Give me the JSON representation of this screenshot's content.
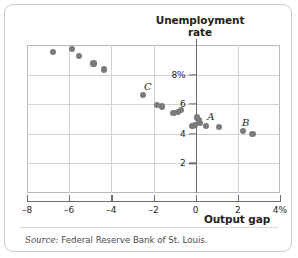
{
  "figure": {
    "title_line1": "Unemployment",
    "title_line2": "rate",
    "source_label": "Source:",
    "source_text": "Federal Reserve Bank of St. Louis."
  },
  "chart_data": {
    "type": "scatter",
    "title": "Unemployment rate",
    "xlabel": "Output gap",
    "ylabel": "Unemployment rate",
    "xlim": [
      -8,
      4
    ],
    "ylim": [
      0,
      10
    ],
    "xticks": [
      -8,
      -6,
      -4,
      -2,
      0,
      2,
      4
    ],
    "xticklabels": [
      "–8",
      "–6",
      "–4",
      "–2",
      "0",
      "2",
      "4%"
    ],
    "yticks": [
      2,
      4,
      6,
      8
    ],
    "yticklabels": [
      "2",
      "4",
      "6",
      "8%"
    ],
    "grid": true,
    "legend": "none",
    "point_color": "#7b7b7b",
    "axis_color": "#6d6d6d",
    "grid_color": "#d2d2d2",
    "points": [
      {
        "x": -6.75,
        "y": 9.5
      },
      {
        "x": -5.85,
        "y": 9.75
      },
      {
        "x": -5.55,
        "y": 9.25
      },
      {
        "x": -4.85,
        "y": 8.75
      },
      {
        "x": -4.35,
        "y": 8.35
      },
      {
        "x": -2.5,
        "y": 6.6,
        "label": "C"
      },
      {
        "x": -1.85,
        "y": 5.95
      },
      {
        "x": -1.6,
        "y": 5.85
      },
      {
        "x": -1.05,
        "y": 5.4
      },
      {
        "x": -0.85,
        "y": 5.45
      },
      {
        "x": -0.7,
        "y": 5.6
      },
      {
        "x": -0.15,
        "y": 4.55
      },
      {
        "x": -0.05,
        "y": 4.6
      },
      {
        "x": 0.08,
        "y": 5.1
      },
      {
        "x": 0.15,
        "y": 4.95
      },
      {
        "x": 0.2,
        "y": 4.75,
        "label": "A"
      },
      {
        "x": 0.5,
        "y": 4.5
      },
      {
        "x": 1.1,
        "y": 4.45
      },
      {
        "x": 2.25,
        "y": 4.2,
        "label": "B"
      },
      {
        "x": 2.7,
        "y": 4.0
      }
    ],
    "annotations": [
      {
        "text": "A",
        "x": 0.55,
        "y": 5.15
      },
      {
        "text": "B",
        "x": 2.2,
        "y": 4.75
      },
      {
        "text": "C",
        "x": -2.45,
        "y": 7.15
      }
    ]
  }
}
